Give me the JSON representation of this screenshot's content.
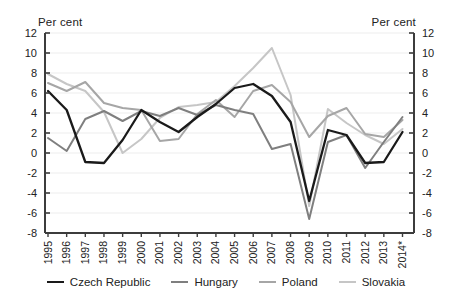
{
  "chart_data": {
    "type": "line",
    "title": "",
    "ylabel_left": "Per cent",
    "ylabel_right": "Per cent",
    "xlabel": "",
    "ylim": [
      -8,
      12
    ],
    "y_ticks": [
      12,
      10,
      8,
      6,
      4,
      2,
      0,
      -2,
      -4,
      -6,
      -8
    ],
    "grid": true,
    "legend_position": "bottom",
    "categories": [
      "1995",
      "1996",
      "1997",
      "1998",
      "1999",
      "2000",
      "2001",
      "2002",
      "2003",
      "2004",
      "2005",
      "2006",
      "2007",
      "2008",
      "2009",
      "2010",
      "2011",
      "2012",
      "2013",
      "2014*"
    ],
    "series": [
      {
        "name": "Czech Republic",
        "color": "#1a1a1a",
        "width": 2.3,
        "values": [
          6.2,
          4.3,
          -0.9,
          -1.0,
          1.3,
          4.3,
          3.1,
          2.1,
          3.6,
          4.9,
          6.5,
          6.9,
          5.7,
          3.1,
          -4.8,
          2.3,
          1.8,
          -1.0,
          -0.9,
          2.1
        ]
      },
      {
        "name": "Hungary",
        "color": "#7f7f7f",
        "width": 2,
        "values": [
          1.5,
          0.2,
          3.4,
          4.2,
          3.2,
          4.2,
          3.7,
          4.5,
          3.8,
          4.8,
          4.3,
          3.9,
          0.4,
          0.9,
          -6.6,
          1.1,
          1.8,
          -1.5,
          1.1,
          3.6
        ]
      },
      {
        "name": "Poland",
        "color": "#a6a6a6",
        "width": 2,
        "values": [
          7.0,
          6.2,
          7.1,
          5.0,
          4.5,
          4.3,
          1.2,
          1.4,
          3.9,
          5.3,
          3.6,
          6.2,
          6.8,
          5.1,
          1.6,
          3.7,
          4.5,
          1.9,
          1.6,
          3.3
        ]
      },
      {
        "name": "Slovakia",
        "color": "#c6c6c6",
        "width": 2,
        "values": [
          7.9,
          6.9,
          6.2,
          4.1,
          0.0,
          1.4,
          3.5,
          4.6,
          4.8,
          5.1,
          6.7,
          8.5,
          10.5,
          5.8,
          -5.3,
          4.4,
          3.0,
          1.8,
          0.9,
          2.4
        ]
      }
    ],
    "axis_color": "#3c3c3c",
    "grid_color": "#ededed",
    "text_color": "#222222"
  }
}
